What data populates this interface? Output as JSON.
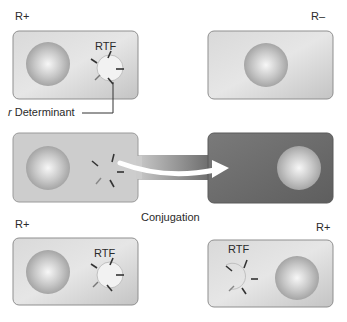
{
  "diagram": {
    "cells": {
      "top_left": {
        "label": "R+",
        "plasmid_label": "RTF"
      },
      "top_right": {
        "label": "R–"
      },
      "middle": {
        "caption": "Conjugation"
      },
      "bottom_left": {
        "label": "R+",
        "plasmid_label": "RTF"
      },
      "bottom_right": {
        "label": "R+",
        "plasmid_label": "RTF"
      }
    },
    "annotations": {
      "r_determinant": {
        "italic_prefix": "r",
        "text": " Determinant"
      }
    },
    "colors": {
      "cell_light": "#cfcfcf",
      "cell_dark": "#6f6f6f",
      "cell_border": "#8a8a8a",
      "nucleoid": "#b5b5b5",
      "nucleoid_highlight": "#f0f0f0",
      "arrow": "#ffffff",
      "plasmid_marks": "#333333"
    }
  }
}
